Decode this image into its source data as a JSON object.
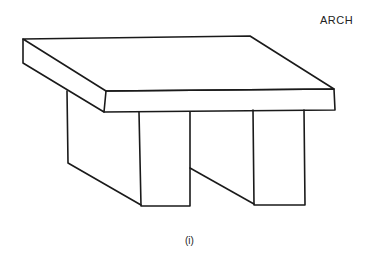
{
  "diagram": {
    "title": "ARCH",
    "caption": "(i)",
    "components": [
      {
        "name": "slab",
        "type": "lintel"
      },
      {
        "name": "left-pillar",
        "type": "block"
      },
      {
        "name": "right-pillar",
        "type": "block"
      }
    ],
    "colors": {
      "line": "#1a1a1a",
      "background": "#ffffff"
    }
  }
}
